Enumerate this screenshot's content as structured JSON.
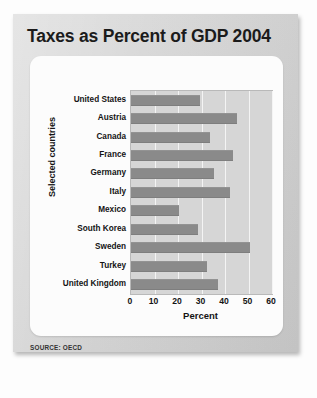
{
  "figure": {
    "title": "Taxes as Percent of GDP 2004",
    "source": "SOURCE: OECD"
  },
  "chart_data": {
    "type": "bar",
    "orientation": "horizontal",
    "title": "Taxes as Percent of GDP 2004",
    "xlabel": "Percent",
    "ylabel": "Selected countries",
    "xlim": [
      0,
      60
    ],
    "xticks": [
      0,
      10,
      20,
      30,
      40,
      50,
      60
    ],
    "grid": "vertical",
    "legend": "none",
    "bar_color": "#8a8a8a",
    "plot_background": "#d6d6d6",
    "categories": [
      "United States",
      "Austria",
      "Canada",
      "France",
      "Germany",
      "Italy",
      "Mexico",
      "South Korea",
      "Sweden",
      "Turkey",
      "United Kingdom"
    ],
    "values": [
      29.5,
      45,
      33.5,
      43.5,
      35.5,
      42,
      20.5,
      28.5,
      50.5,
      32.5,
      37
    ]
  }
}
